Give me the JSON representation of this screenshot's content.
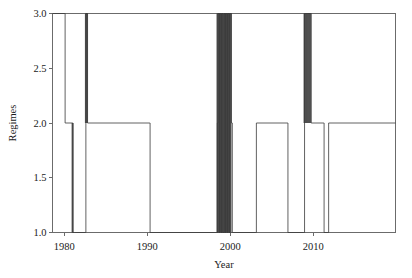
{
  "chart_data": {
    "type": "line",
    "title": "",
    "subtitle": "",
    "xlabel": "Year",
    "ylabel": "Regimes",
    "xlim": [
      1978.6,
      2019.9
    ],
    "ylim": [
      1.0,
      3.0
    ],
    "grid": false,
    "legend": null,
    "line_color": "#3a3a3a",
    "step_style": "post",
    "xticks": [
      1980,
      1990,
      2000,
      2010
    ],
    "xtick_labels": [
      "1980",
      "1990",
      "2000",
      "2010"
    ],
    "yticks": [
      1.0,
      1.5,
      2.0,
      2.5,
      3.0
    ],
    "ytick_labels": [
      "1.0",
      "1.5",
      "2.0",
      "2.5",
      "3.0"
    ],
    "series": [
      {
        "name": "Regimes",
        "x": [
          1978.6,
          1980.05,
          1980.12,
          1980.95,
          1981.05,
          1981.22,
          1981.3,
          1982.55,
          1982.62,
          1982.68,
          1982.75,
          1982.82,
          1990.25,
          1990.35,
          1998.35,
          1998.45,
          1998.52,
          1998.6,
          1998.68,
          1998.75,
          1998.82,
          1998.9,
          1998.98,
          1999.05,
          1999.12,
          1999.2,
          1999.28,
          1999.35,
          1999.42,
          1999.5,
          1999.58,
          1999.65,
          1999.72,
          1999.8,
          1999.88,
          1999.95,
          2000.05,
          2000.15,
          2000.25,
          2003.05,
          2003.15,
          2006.85,
          2006.95,
          2008.85,
          2008.95,
          2009.05,
          2009.65,
          2009.75,
          2011.2,
          2011.3,
          2011.75,
          2011.85,
          2019.9
        ],
        "y": [
          3.0,
          3.0,
          2.0,
          2.0,
          1.0,
          1.0,
          1.0,
          1.0,
          3.0,
          3.0,
          3.0,
          2.0,
          2.0,
          1.0,
          1.0,
          2.0,
          3.0,
          3.0,
          1.0,
          3.0,
          3.0,
          1.0,
          3.0,
          3.0,
          1.0,
          1.0,
          3.0,
          3.0,
          1.0,
          3.0,
          3.0,
          1.0,
          3.0,
          3.0,
          1.0,
          3.0,
          3.0,
          2.0,
          1.0,
          1.0,
          2.0,
          2.0,
          1.0,
          1.0,
          3.0,
          3.0,
          3.0,
          2.0,
          2.0,
          1.0,
          1.0,
          2.0,
          2.0
        ],
        "description": "Regime state index switching between 1, 2 and 3 over time"
      }
    ],
    "segments": [
      {
        "start": 1978.6,
        "end": 1980.08,
        "level": 3.0,
        "note": "initial high regime"
      },
      {
        "start": 1980.08,
        "end": 1981.0,
        "level": 2.0,
        "note": "step down to regime 2"
      },
      {
        "start": 1981.0,
        "end": 1982.58,
        "level": 1.0,
        "note": "low regime early 1980s"
      },
      {
        "start": 1982.58,
        "end": 1982.78,
        "level": 3.0,
        "note": "brief spike to regime 3"
      },
      {
        "start": 1982.78,
        "end": 1990.28,
        "level": 2.0,
        "note": "long stable regime 2"
      },
      {
        "start": 1990.28,
        "end": 1990.33,
        "level": 1.0,
        "note": "single narrow dip at 1990"
      },
      {
        "start": 1990.33,
        "end": 1998.4,
        "level": 2.0,
        "note": "stable regime 2 through the 1990s"
      },
      {
        "start": 1998.4,
        "end": 2000.1,
        "level": 3.0,
        "note": "dense oscillation cluster 1998-2000 between 1 and 3"
      },
      {
        "start": 2000.1,
        "end": 2003.1,
        "level": 1.0,
        "note": "low regime 2000-2003"
      },
      {
        "start": 2003.1,
        "end": 2006.9,
        "level": 2.0,
        "note": "regime 2"
      },
      {
        "start": 2006.9,
        "end": 2008.9,
        "level": 1.0,
        "note": "low regime 2007-2009"
      },
      {
        "start": 2008.9,
        "end": 2009.7,
        "level": 3.0,
        "note": "spike to regime 3 around 2009"
      },
      {
        "start": 2009.7,
        "end": 2011.25,
        "level": 2.0,
        "note": "regime 2"
      },
      {
        "start": 2011.25,
        "end": 2011.8,
        "level": 1.0,
        "note": "narrow dip around 2011"
      },
      {
        "start": 2011.8,
        "end": 2019.9,
        "level": 2.0,
        "note": "stable regime 2 to end of record"
      }
    ],
    "dense_cluster": {
      "range": [
        1998.4,
        2000.1
      ],
      "description": "rapid alternation between regime 1 and regime 3 producing a solid dark band",
      "approx_switches": 40
    }
  },
  "axes": {
    "frame_color": "#6b6b6b",
    "background": "#ffffff"
  }
}
